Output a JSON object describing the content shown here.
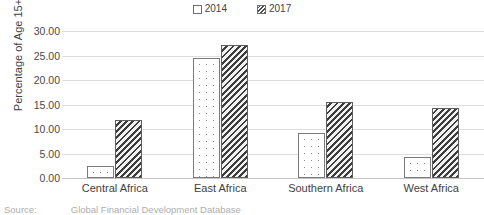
{
  "chart_data": {
    "type": "bar",
    "title": "",
    "xlabel": "",
    "ylabel": "Percentage of Age 15+",
    "categories": [
      "Central Africa",
      "East Africa",
      "Southern Africa",
      "West Africa"
    ],
    "series": [
      {
        "name": "2014",
        "values": [
          2.5,
          24.5,
          9.1,
          4.2
        ]
      },
      {
        "name": "2017",
        "values": [
          11.9,
          27.2,
          15.5,
          14.3
        ]
      }
    ],
    "ylim": [
      0.0,
      30.0
    ],
    "ytick_step": 5.0,
    "ytick_labels": [
      "0.00",
      "5.00",
      "10.00",
      "15.00",
      "20.00",
      "25.00",
      "30.00"
    ],
    "grid": true,
    "legend_position": "top-center"
  },
  "legend": {
    "entries": [
      {
        "label": "2014",
        "swatch": "white-dotted-square"
      },
      {
        "label": "2017",
        "swatch": "dark-hatched-square"
      }
    ]
  },
  "caption": {
    "source_label": "Source:",
    "source_text": "Global Financial Development Database"
  }
}
